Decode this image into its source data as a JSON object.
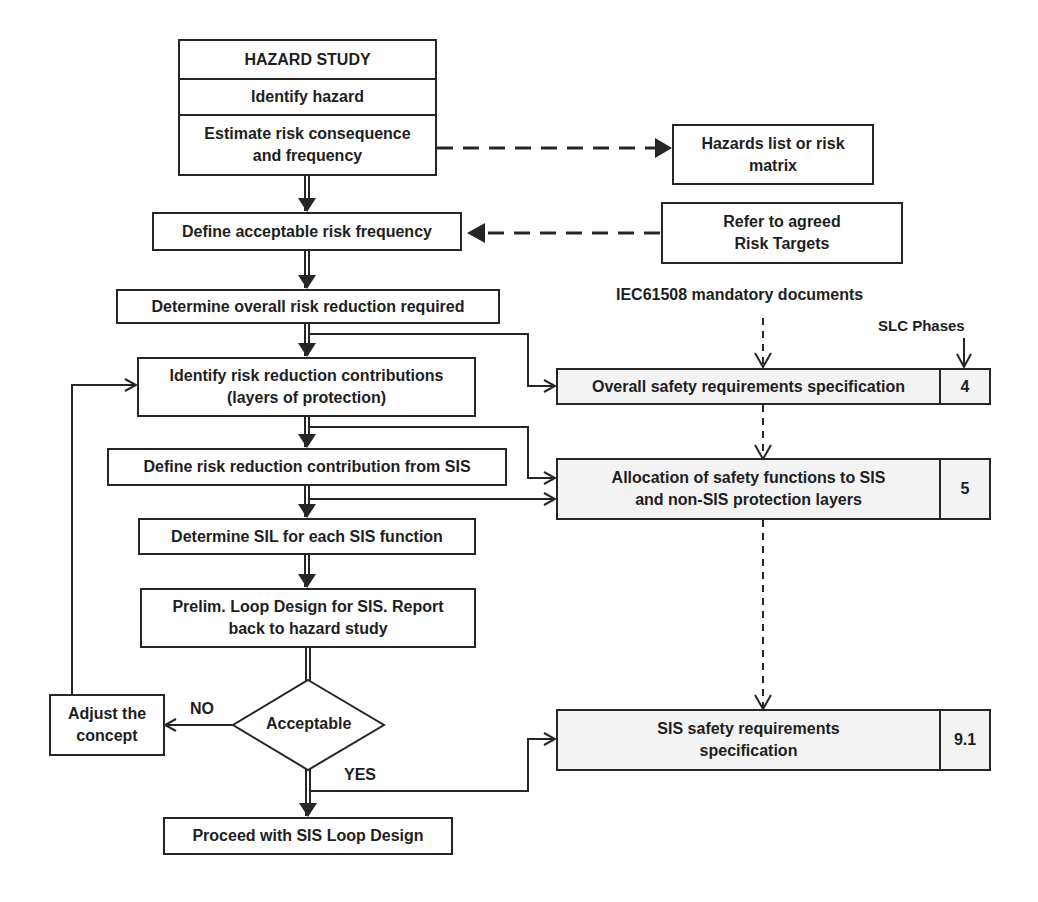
{
  "hazard_study": {
    "title": "HAZARD STUDY",
    "identify": "Identify hazard",
    "estimate": [
      "Estimate risk consequence",
      "and frequency"
    ]
  },
  "steps": {
    "define_acceptable": "Define acceptable risk frequency",
    "determine_overall": "Determine overall risk reduction required",
    "identify_contributions": [
      "Identify risk reduction contributions",
      "(layers of protection)"
    ],
    "define_sis_contribution": "Define risk reduction contribution from SIS",
    "determine_sil": "Determine SIL for each SIS function",
    "prelim_loop": [
      "Prelim. Loop Design for SIS. Report",
      "back to hazard study"
    ],
    "decision": "Acceptable",
    "adjust": [
      "Adjust the",
      "concept"
    ],
    "proceed": "Proceed with SIS Loop Design"
  },
  "branch_labels": {
    "no": "NO",
    "yes": "YES"
  },
  "side_boxes": {
    "hazards_list": [
      "Hazards list or risk",
      "matrix"
    ],
    "risk_targets": [
      "Refer to agreed",
      "Risk Targets"
    ]
  },
  "annotations": {
    "mandatory_docs": "IEC61508 mandatory documents",
    "slc_phases": "SLC Phases"
  },
  "documents": [
    {
      "text": [
        "Overall safety requirements specification"
      ],
      "phase": "4"
    },
    {
      "text": [
        "Allocation of safety functions to SIS",
        "and non-SIS protection layers"
      ],
      "phase": "5"
    },
    {
      "text": [
        "SIS safety requirements",
        "specification"
      ],
      "phase": "9.1"
    }
  ],
  "colors": {
    "line": "#262626",
    "doc_fill": "#f3f3f3",
    "background": "#ffffff"
  }
}
